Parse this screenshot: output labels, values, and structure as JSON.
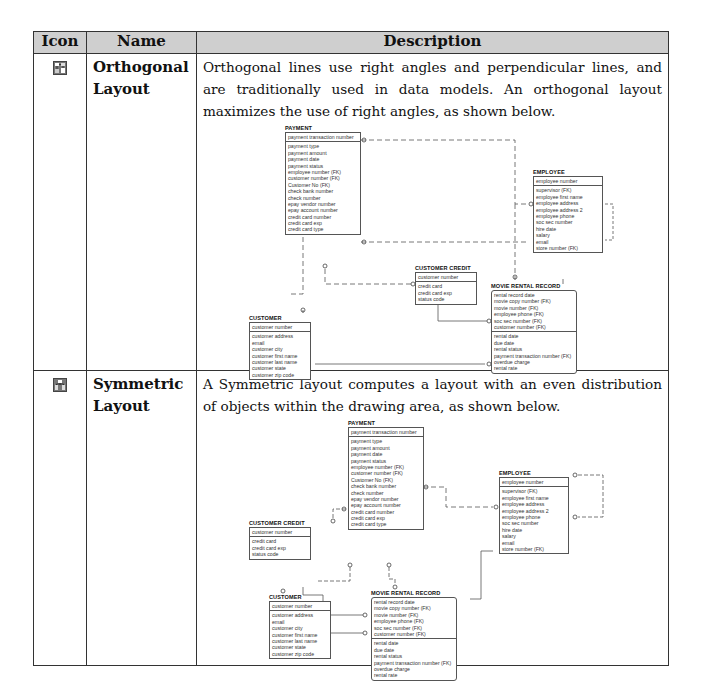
{
  "table": {
    "headers": [
      "Icon",
      "Name",
      "Description"
    ],
    "rows": [
      {
        "icon": "orthogonal-layout-icon",
        "name_line1": "Orthogonal",
        "name_line2": "Layout",
        "description": "Orthogonal lines use right angles and perpendicular lines, and are traditionally used in data models. An orthogonal layout maximizes the use of right angles, as shown below.",
        "diagram": {
          "payment": {
            "title": "PAYMENT",
            "key": [
              "payment transaction number"
            ],
            "attrs": [
              "payment type",
              "payment amount",
              "payment date",
              "payment status",
              "employee number (FK)",
              "customer number (FK)",
              "Customer No (FK)",
              "check bank number",
              "check number",
              "epay vendor number",
              "epay account number",
              "credit card number",
              "credit card exp",
              "credit card type"
            ]
          },
          "employee": {
            "title": "EMPLOYEE",
            "key": [
              "employee number"
            ],
            "attrs": [
              "supervisor (FK)",
              "employee first name",
              "employee address",
              "employee address 2",
              "employee phone",
              "soc sec number",
              "hire date",
              "salary",
              "email",
              "store number (FK)"
            ]
          },
          "customer_credit": {
            "title": "CUSTOMER CREDIT",
            "key": [
              "customer number"
            ],
            "attrs": [
              "credit card",
              "credit card exp",
              "status code"
            ]
          },
          "movie_rental_record": {
            "title": "MOVIE RENTAL RECORD",
            "key": [
              "rental record date",
              "movie copy number (FK)",
              "movie number (FK)",
              "employee phone (FK)",
              "soc sec number (FK)",
              "customer number (FK)"
            ],
            "attrs": [
              "rental date",
              "due date",
              "rental status",
              "payment transaction number (FK)",
              "overdue charge",
              "rental rate"
            ]
          },
          "customer": {
            "title": "CUSTOMER",
            "key": [
              "customer number"
            ],
            "attrs": [
              "customer address",
              "email",
              "customer city",
              "customer first name",
              "customer last name",
              "customer state",
              "customer zip code"
            ]
          }
        }
      },
      {
        "icon": "symmetric-layout-icon",
        "name_line1": "Symmetric",
        "name_line2": "Layout",
        "description": "A Symmetric layout computes a layout with an even distribution of objects within the drawing area, as shown below.",
        "diagram": {
          "payment": {
            "title": "PAYMENT",
            "key": [
              "payment transaction number"
            ],
            "attrs": [
              "payment type",
              "payment amount",
              "payment date",
              "payment status",
              "employee number (FK)",
              "customer number (FK)",
              "Customer No (FK)",
              "check bank number",
              "check number",
              "epay vendor number",
              "epay account number",
              "credit card number",
              "credit card exp",
              "credit card type"
            ]
          },
          "employee": {
            "title": "EMPLOYEE",
            "key": [
              "employee number"
            ],
            "attrs": [
              "supervisor (FK)",
              "employee first name",
              "employee address",
              "employee address 2",
              "employee phone",
              "soc sec number",
              "hire date",
              "salary",
              "email",
              "store number (FK)"
            ]
          },
          "customer_credit": {
            "title": "CUSTOMER CREDIT",
            "key": [
              "customer number"
            ],
            "attrs": [
              "credit card",
              "credit card exp",
              "status code"
            ]
          },
          "movie_rental_record": {
            "title": "MOVIE RENTAL RECORD",
            "key": [
              "rental record date",
              "movie copy number (FK)",
              "movie number (FK)",
              "employee phone (FK)",
              "soc sec number (FK)",
              "customer number (FK)"
            ],
            "attrs": [
              "rental date",
              "due date",
              "rental status",
              "payment transaction number (FK)",
              "overdue charge",
              "rental rate"
            ]
          },
          "customer": {
            "title": "CUSTOMER",
            "key": [
              "customer number"
            ],
            "attrs": [
              "customer address",
              "email",
              "customer city",
              "customer first name",
              "customer last name",
              "customer state",
              "customer zip code"
            ]
          }
        }
      }
    ]
  }
}
